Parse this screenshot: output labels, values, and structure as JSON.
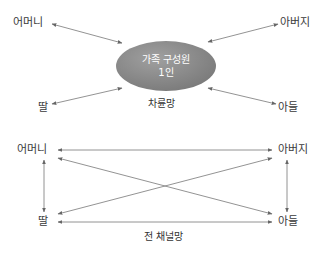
{
  "top_diagram": {
    "center": {
      "line1": "가족 구성원",
      "line2": "1인",
      "color": "#8a8a8a"
    },
    "caption": "차륜망",
    "nodes": {
      "mother": "어머니",
      "father": "아버지",
      "daughter": "딸",
      "son": "아들"
    }
  },
  "bottom_diagram": {
    "caption": "전 채널망",
    "nodes": {
      "mother": "어머니",
      "father": "아버지",
      "daughter": "딸",
      "son": "아들"
    }
  },
  "colors": {
    "arrow": "#666666",
    "text": "#333333"
  }
}
